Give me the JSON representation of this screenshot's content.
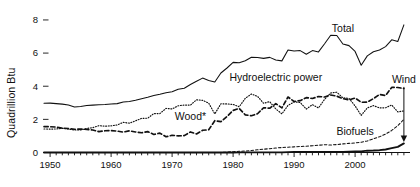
{
  "chart_data": {
    "type": "line",
    "title": "",
    "xlabel": "",
    "ylabel": "Quadrillion Btu",
    "xlim": [
      1949,
      2009
    ],
    "ylim": [
      0,
      8.6
    ],
    "yticks": [
      0,
      2,
      4,
      6,
      8
    ],
    "ytick_labels": [
      "0",
      "2",
      "4",
      "6",
      "8"
    ],
    "xticks": [
      1950,
      1960,
      1970,
      1980,
      1990,
      2000
    ],
    "xtick_labels": [
      "1950",
      "1960",
      "1970",
      "1980",
      "1990",
      "2000"
    ],
    "minor_xtick_interval": 1,
    "grid": false,
    "legend": "inline-annotations",
    "x": [
      1949,
      1950,
      1951,
      1952,
      1953,
      1954,
      1955,
      1956,
      1957,
      1958,
      1959,
      1960,
      1961,
      1962,
      1963,
      1964,
      1965,
      1966,
      1967,
      1968,
      1969,
      1970,
      1971,
      1972,
      1973,
      1974,
      1975,
      1976,
      1977,
      1978,
      1979,
      1980,
      1981,
      1982,
      1983,
      1984,
      1985,
      1986,
      1987,
      1988,
      1989,
      1990,
      1991,
      1992,
      1993,
      1994,
      1995,
      1996,
      1997,
      1998,
      1999,
      2000,
      2001,
      2002,
      2003,
      2004,
      2005,
      2006,
      2007,
      2008
    ],
    "series": [
      {
        "name": "Total",
        "style": "solid",
        "label": "Total",
        "values": [
          2.97,
          2.98,
          2.95,
          2.92,
          2.87,
          2.75,
          2.78,
          2.84,
          2.86,
          2.88,
          2.9,
          2.93,
          2.95,
          3.05,
          3.08,
          3.15,
          3.25,
          3.33,
          3.44,
          3.52,
          3.61,
          3.67,
          3.82,
          3.88,
          4.1,
          4.3,
          4.49,
          4.35,
          4.25,
          4.8,
          5.1,
          5.44,
          5.42,
          5.54,
          5.75,
          5.73,
          5.68,
          5.74,
          5.58,
          5.53,
          6.19,
          6.13,
          6.15,
          5.93,
          6.15,
          6.07,
          6.56,
          7.08,
          7.06,
          6.55,
          6.45,
          6.1,
          5.27,
          5.83,
          6.08,
          6.19,
          6.39,
          6.8,
          6.7,
          7.7
        ]
      },
      {
        "name": "Hydroelectric power",
        "style": "dotted",
        "label": "Hydroelectric power",
        "values": [
          1.42,
          1.41,
          1.42,
          1.46,
          1.41,
          1.36,
          1.36,
          1.45,
          1.5,
          1.62,
          1.59,
          1.61,
          1.66,
          1.82,
          1.77,
          1.91,
          2.06,
          2.07,
          2.35,
          2.35,
          2.66,
          2.63,
          2.82,
          2.86,
          2.86,
          3.18,
          3.15,
          2.98,
          2.33,
          2.94,
          2.93,
          2.9,
          2.76,
          3.27,
          3.53,
          3.39,
          2.97,
          3.07,
          2.63,
          2.33,
          2.84,
          3.05,
          3.02,
          2.62,
          2.89,
          2.69,
          3.21,
          3.59,
          3.64,
          3.3,
          3.27,
          2.81,
          2.24,
          2.69,
          2.83,
          2.69,
          2.7,
          2.87,
          2.45,
          2.51
        ]
      },
      {
        "name": "Wood*",
        "style": "dashed-thick",
        "label": "Wood*",
        "values": [
          1.56,
          1.56,
          1.53,
          1.47,
          1.45,
          1.4,
          1.42,
          1.39,
          1.36,
          1.26,
          1.31,
          1.32,
          1.29,
          1.23,
          1.31,
          1.24,
          1.19,
          1.26,
          1.09,
          1.17,
          0.95,
          1.04,
          1.0,
          1.02,
          1.24,
          1.12,
          1.34,
          1.37,
          1.92,
          1.86,
          2.17,
          2.54,
          2.66,
          2.27,
          2.22,
          2.34,
          2.7,
          2.67,
          2.95,
          2.69,
          3.35,
          3.08,
          3.13,
          3.31,
          3.26,
          3.38,
          3.35,
          3.47,
          3.4,
          3.25,
          3.18,
          3.29,
          3.03,
          3.04,
          3.25,
          3.5,
          3.44,
          3.93,
          3.92,
          3.86
        ]
      },
      {
        "name": "Biofuels",
        "style": "dashed-thin",
        "label": "Biofuels",
        "values": [
          0,
          0,
          0,
          0,
          0,
          0,
          0,
          0,
          0,
          0,
          0,
          0,
          0,
          0,
          0,
          0,
          0,
          0,
          0,
          0,
          0,
          0,
          0,
          0,
          0,
          0,
          0,
          0,
          0,
          0,
          0.02,
          0.05,
          0.07,
          0.09,
          0.12,
          0.16,
          0.2,
          0.23,
          0.27,
          0.3,
          0.32,
          0.34,
          0.36,
          0.38,
          0.41,
          0.44,
          0.47,
          0.45,
          0.48,
          0.52,
          0.55,
          0.58,
          0.62,
          0.7,
          0.83,
          0.95,
          1.11,
          1.33,
          1.62,
          2.0
        ]
      },
      {
        "name": "Wind",
        "style": "solid-thick",
        "label": "Wind",
        "values": [
          0,
          0,
          0,
          0,
          0,
          0,
          0,
          0,
          0,
          0,
          0,
          0,
          0,
          0,
          0,
          0,
          0,
          0,
          0,
          0,
          0,
          0,
          0,
          0,
          0,
          0,
          0,
          0,
          0,
          0,
          0,
          0,
          0.01,
          0.01,
          0.01,
          0.01,
          0.01,
          0.01,
          0.01,
          0.01,
          0.02,
          0.03,
          0.03,
          0.03,
          0.03,
          0.04,
          0.03,
          0.03,
          0.03,
          0.03,
          0.05,
          0.06,
          0.07,
          0.11,
          0.12,
          0.14,
          0.18,
          0.26,
          0.34,
          0.55
        ]
      }
    ],
    "annotations": [
      {
        "name": "total-label",
        "text": "Total",
        "x": 1998,
        "y": 7.3
      },
      {
        "name": "hydro-label",
        "text": "Hydroelectric power",
        "x": 1987,
        "y": 4.3
      },
      {
        "name": "wood-label",
        "text": "Wood*",
        "x": 1973,
        "y": 1.95
      },
      {
        "name": "biofuels-label",
        "text": "Biofuels",
        "x": 2000,
        "y": 1.05
      },
      {
        "name": "wind-label",
        "text": "Wind",
        "x": 2008,
        "y": 4.2,
        "leader": true
      }
    ],
    "colors": {
      "ink": "#111111",
      "background": "#ffffff"
    }
  }
}
